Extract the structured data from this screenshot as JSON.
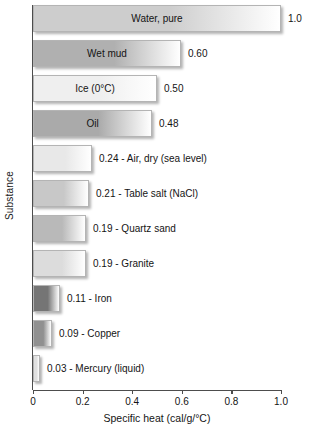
{
  "chart_data": {
    "type": "bar",
    "orientation": "horizontal",
    "title": "",
    "xlabel": "Specific heat (cal/g/°C)",
    "ylabel": "Substance",
    "xlim": [
      0,
      1.0
    ],
    "grid": false,
    "legend": null,
    "xticks": [
      "0",
      "0.2",
      "0.4",
      "0.6",
      "0.8",
      "1.0"
    ],
    "xtick_values": [
      0,
      0.2,
      0.4,
      0.6,
      0.8,
      1.0
    ],
    "categories": [
      "Water, pure",
      "Wet mud",
      "Ice (0°C)",
      "Oil",
      "Air, dry (sea level)",
      "Table salt (NaCl)",
      "Quartz sand",
      "Granite",
      "Iron",
      "Copper",
      "Mercury (liquid)"
    ],
    "values": [
      1.0,
      0.6,
      0.5,
      0.48,
      0.24,
      0.21,
      0.19,
      0.19,
      0.11,
      0.09,
      0.03
    ],
    "value_labels": [
      "1.0",
      "0.60",
      "0.50",
      "0.48",
      "0.24",
      "0.21",
      "0.19",
      "0.19",
      "0.11",
      "0.09",
      "0.03"
    ],
    "bars": [
      {
        "name": "Water, pure",
        "value": 1.0,
        "value_label": "1.0",
        "label_inside": true,
        "inside_text": "Water, pure",
        "outside_text": "1.0",
        "color": "#cdcdcd",
        "bar_px": 248
      },
      {
        "name": "Wet mud",
        "value": 0.6,
        "value_label": "0.60",
        "label_inside": true,
        "inside_text": "Wet mud",
        "outside_text": "0.60",
        "color": "#b0b0b0",
        "bar_px": 148
      },
      {
        "name": "Ice (0°C)",
        "value": 0.5,
        "value_label": "0.50",
        "label_inside": true,
        "inside_text": "Ice (0°C)",
        "outside_text": "0.50",
        "color": "#efefef",
        "bar_px": 124
      },
      {
        "name": "Oil",
        "value": 0.48,
        "value_label": "0.48",
        "label_inside": true,
        "inside_text": "Oil",
        "outside_text": "0.48",
        "color": "#aaaaaa",
        "bar_px": 119
      },
      {
        "name": "Air, dry (sea level)",
        "value": 0.24,
        "value_label": "0.24",
        "label_inside": false,
        "inside_text": "",
        "outside_text": "0.24 - Air, dry (sea level)",
        "color": "#e8e8e8",
        "bar_px": 59
      },
      {
        "name": "Table salt (NaCl)",
        "value": 0.21,
        "value_label": "0.21",
        "label_inside": false,
        "inside_text": "",
        "outside_text": "0.21 - Table salt (NaCl)",
        "color": "#c8c8c8",
        "bar_px": 56
      },
      {
        "name": "Quartz sand",
        "value": 0.19,
        "value_label": "0.19",
        "label_inside": false,
        "inside_text": "",
        "outside_text": "0.19 - Quartz sand",
        "color": "#b9b9b9",
        "bar_px": 53
      },
      {
        "name": "Granite",
        "value": 0.19,
        "value_label": "0.19",
        "label_inside": false,
        "inside_text": "",
        "outside_text": "0.19 - Granite",
        "color": "#dcdcdc",
        "bar_px": 53
      },
      {
        "name": "Iron",
        "value": 0.11,
        "value_label": "0.11",
        "label_inside": false,
        "inside_text": "",
        "outside_text": "0.11 - Iron",
        "color": "#757575",
        "bar_px": 27
      },
      {
        "name": "Copper",
        "value": 0.09,
        "value_label": "0.09",
        "label_inside": false,
        "inside_text": "",
        "outside_text": "0.09 - Copper",
        "color": "#909090",
        "bar_px": 19
      },
      {
        "name": "Mercury (liquid)",
        "value": 0.03,
        "value_label": "0.03",
        "label_inside": false,
        "inside_text": "",
        "outside_text": "0.03 - Mercury (liquid)",
        "color": "#e0e0e0",
        "bar_px": 7
      }
    ]
  }
}
